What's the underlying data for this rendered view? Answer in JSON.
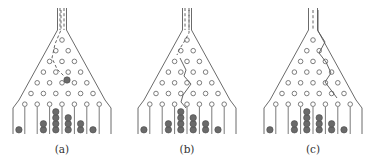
{
  "figure": {
    "panels": [
      {
        "id": "a",
        "label": "(a)",
        "center_x": 62,
        "path_style": "dashed-then-ball",
        "highlight_ball": [
          67,
          80
        ],
        "path_points_dashed": [
          [
            61,
            10
          ],
          [
            61,
            30
          ],
          [
            55,
            44
          ],
          [
            52,
            58
          ],
          [
            57,
            69
          ],
          [
            64,
            76
          ]
        ],
        "path_points_solid": [],
        "neck_dashes": [
          60,
          64
        ],
        "bin_counts": [
          1,
          0,
          2,
          4,
          3,
          2,
          1,
          0
        ]
      },
      {
        "id": "b",
        "label": "(b)",
        "center_x": 187,
        "path_style": "dashed-then-solid",
        "highlight_ball": null,
        "path_points_dashed": [
          [
            189,
            10
          ],
          [
            189,
            33
          ],
          [
            184,
            42
          ],
          [
            179,
            50
          ],
          [
            177,
            55
          ]
        ],
        "path_points_solid": [
          [
            180,
            58
          ],
          [
            186,
            70
          ],
          [
            184,
            76
          ],
          [
            191,
            84
          ],
          [
            183,
            95
          ],
          [
            181,
            102
          ],
          [
            186,
            108
          ]
        ],
        "neck_dashes": [
          185,
          189
        ],
        "bin_counts": [
          1,
          0,
          2,
          4,
          3,
          2,
          1,
          0
        ]
      },
      {
        "id": "c",
        "label": "(c)",
        "center_x": 313,
        "path_style": "solid",
        "highlight_ball": null,
        "path_points_dashed": [
          [
            313,
            10
          ],
          [
            313,
            30
          ]
        ],
        "path_points_solid": [
          [
            318,
            10
          ],
          [
            318,
            31
          ],
          [
            325,
            42
          ],
          [
            319,
            53
          ],
          [
            326,
            62
          ],
          [
            331,
            73
          ],
          [
            325,
            82
          ],
          [
            337,
            98
          ]
        ],
        "neck_dashes": [
          313
        ],
        "bin_counts": [
          1,
          0,
          2,
          4,
          3,
          2,
          1,
          0
        ]
      }
    ],
    "geometry": {
      "neck_half_width": 4.5,
      "neck_top_y": 8,
      "neck_bottom_y": 30,
      "funnel_bottom_y": 100,
      "funnel_half_width_bottom": 43,
      "wall_bottom_y": 134,
      "peg_rows": 7,
      "peg_spacing_x": 12.4,
      "peg_top_y": 40,
      "peg_row_dy": 10.7,
      "peg_radius": 2.3,
      "ball_radius": 3.2,
      "divider_top_y": 107,
      "divider_bottom_y": 134,
      "label_y": 153
    },
    "colors": {
      "line": "#6b6b6b",
      "ball": "#6a6a6a",
      "background": "#ffffff"
    }
  }
}
